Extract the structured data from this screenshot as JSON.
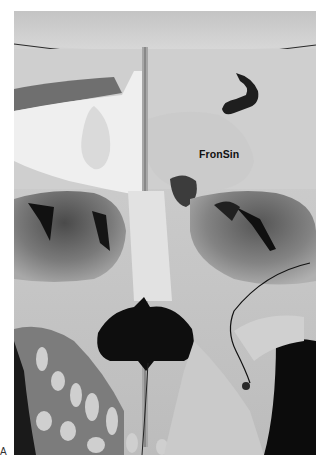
{
  "figure": {
    "panel_letter": "A",
    "labels": [
      {
        "id": "frontal-sinus",
        "text": "FronSin"
      }
    ],
    "style": {
      "mode": "grayscale",
      "background": "#ffffff"
    }
  },
  "photo": {
    "subject": "anterior view of sectioned skull showing frontal sinus, orbits, nasal aperture and maxillary teeth",
    "palette": {
      "bone_light": "#e6e6e6",
      "bone_mid": "#bdbdbd",
      "bone_shadow": "#8a8a8a",
      "cavity_dark": "#141414",
      "background_dark": "#0a0a0a"
    }
  }
}
